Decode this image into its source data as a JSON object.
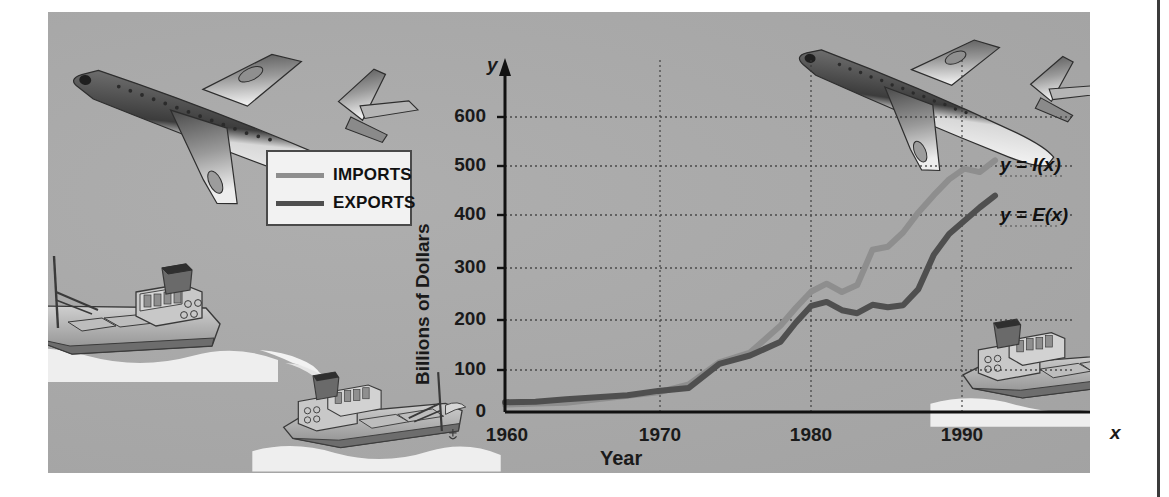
{
  "figure": {
    "panel_color": "#a9a9a9",
    "page_color": "#ffffff"
  },
  "legend": {
    "items": [
      {
        "label": "IMPORTS",
        "color": "#8e8e8e"
      },
      {
        "label": "EXPORTS",
        "color": "#4f4f4f"
      }
    ]
  },
  "annotations": {
    "imports_curve_label": "y = I(x)",
    "exports_curve_label": "y = E(x)",
    "x_axis_name": "x",
    "y_axis_name": "y"
  },
  "illustrations": [
    {
      "name": "airplane-top-left"
    },
    {
      "name": "airplane-top-right"
    },
    {
      "name": "cargo-ship-left"
    },
    {
      "name": "cargo-ship-center"
    },
    {
      "name": "cargo-ship-right"
    }
  ],
  "chart_data": {
    "type": "line",
    "title": "",
    "xlabel": "Year",
    "ylabel": "Billions of Dollars",
    "xlim": [
      1960,
      1994
    ],
    "ylim": [
      0,
      640
    ],
    "grid": true,
    "xticks": [
      1960,
      1970,
      1980,
      1990
    ],
    "xticklabels": [
      "1960",
      "1970",
      "1980",
      "1990"
    ],
    "yticks": [
      0,
      100,
      200,
      300,
      400,
      500,
      600
    ],
    "yticklabels": [
      "0",
      "100",
      "200",
      "300",
      "400",
      "500",
      "600"
    ],
    "legend_position": "upper-left-outside",
    "x": [
      1960,
      1962,
      1964,
      1966,
      1968,
      1970,
      1972,
      1974,
      1976,
      1978,
      1979,
      1980,
      1981,
      1982,
      1983,
      1984,
      1985,
      1986,
      1987,
      1988,
      1989,
      1990,
      1991,
      1992
    ],
    "series": [
      {
        "name": "IMPORTS",
        "label": "y = I(x)",
        "color": "#8e8e8e",
        "values": [
          15,
          17,
          19,
          26,
          33,
          40,
          56,
          101,
          121,
          176,
          212,
          245,
          261,
          244,
          258,
          330,
          336,
          365,
          406,
          441,
          473,
          495,
          488,
          512
        ]
      },
      {
        "name": "EXPORTS",
        "label": "y = E(x)",
        "color": "#4f4f4f",
        "values": [
          20,
          21,
          26,
          30,
          34,
          43,
          49,
          98,
          115,
          143,
          182,
          216,
          224,
          207,
          201,
          218,
          213,
          217,
          250,
          320,
          362,
          389,
          416,
          440
        ]
      }
    ]
  }
}
